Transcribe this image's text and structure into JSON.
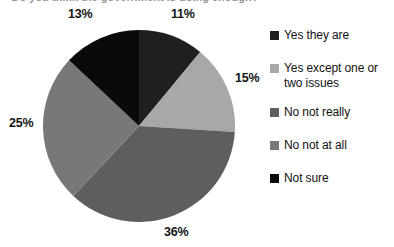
{
  "chart_data": {
    "type": "pie",
    "title": "Do you think the government is doing enough?",
    "title_visible": false,
    "categories": [
      "Yes they are",
      "Yes except one or two issues",
      "No not really",
      "No not at all",
      "Not sure"
    ],
    "values": [
      11,
      15,
      36,
      25,
      13
    ],
    "value_labels": [
      "11%",
      "15%",
      "36%",
      "25%",
      "13%"
    ],
    "units": "percent",
    "start_angle_deg": 0,
    "direction": "clockwise",
    "legend_position": "right",
    "grid": false,
    "xlabel": "",
    "ylabel": "",
    "colors": [
      "#1f1f1f",
      "#a8a8a8",
      "#5e5e5e",
      "#787878",
      "#0a0a0a"
    ],
    "slices": [
      {
        "label": "Yes they are",
        "value": 11,
        "value_label": "11%",
        "color": "#1f1f1f"
      },
      {
        "label": "Yes except one or two issues",
        "value": 15,
        "value_label": "15%",
        "color": "#a8a8a8"
      },
      {
        "label": "No not really",
        "value": 36,
        "value_label": "36%",
        "color": "#5e5e5e"
      },
      {
        "label": "No not at all",
        "value": 25,
        "value_label": "25%",
        "color": "#787878"
      },
      {
        "label": "Not sure",
        "value": 13,
        "value_label": "13%",
        "color": "#0a0a0a"
      }
    ]
  },
  "legend": {
    "items": [
      {
        "label": "Yes they are",
        "color": "#1f1f1f"
      },
      {
        "label": "Yes except one or two issues",
        "color": "#a8a8a8"
      },
      {
        "label": "No not really",
        "color": "#5e5e5e"
      },
      {
        "label": "No not at all",
        "color": "#787878"
      },
      {
        "label": "Not sure",
        "color": "#0a0a0a"
      }
    ]
  }
}
